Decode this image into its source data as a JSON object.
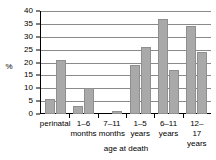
{
  "chart_data": {
    "type": "bar",
    "title": "",
    "xlabel": "age at death",
    "ylabel": "%",
    "categories": [
      "perinatal",
      "1–6\nmonths",
      "7–11\nmonths",
      "1–5\nyears",
      "6–11\nyears",
      "12–17\nyears"
    ],
    "series": [
      {
        "name": "series-1",
        "values": [
          6,
          3,
          0,
          19,
          37,
          34
        ]
      },
      {
        "name": "series-2",
        "values": [
          21,
          10,
          1,
          26,
          17,
          24
        ]
      }
    ],
    "ylim": [
      0,
      40
    ],
    "ytick_step": 5,
    "yticks": [
      0,
      5,
      10,
      15,
      20,
      25,
      30,
      35,
      40
    ],
    "ytick_labels": [
      "0",
      "5",
      "10",
      "15",
      "20",
      "25",
      "30",
      "35",
      "40"
    ],
    "grid": true,
    "grid_axis": "y",
    "legend": false,
    "legend_position": "none",
    "bar_color": "#a9a9a9",
    "bar_border_color": "#8f8f8f",
    "grid_color": "#8a8a8a",
    "axis_color": "#000000"
  }
}
